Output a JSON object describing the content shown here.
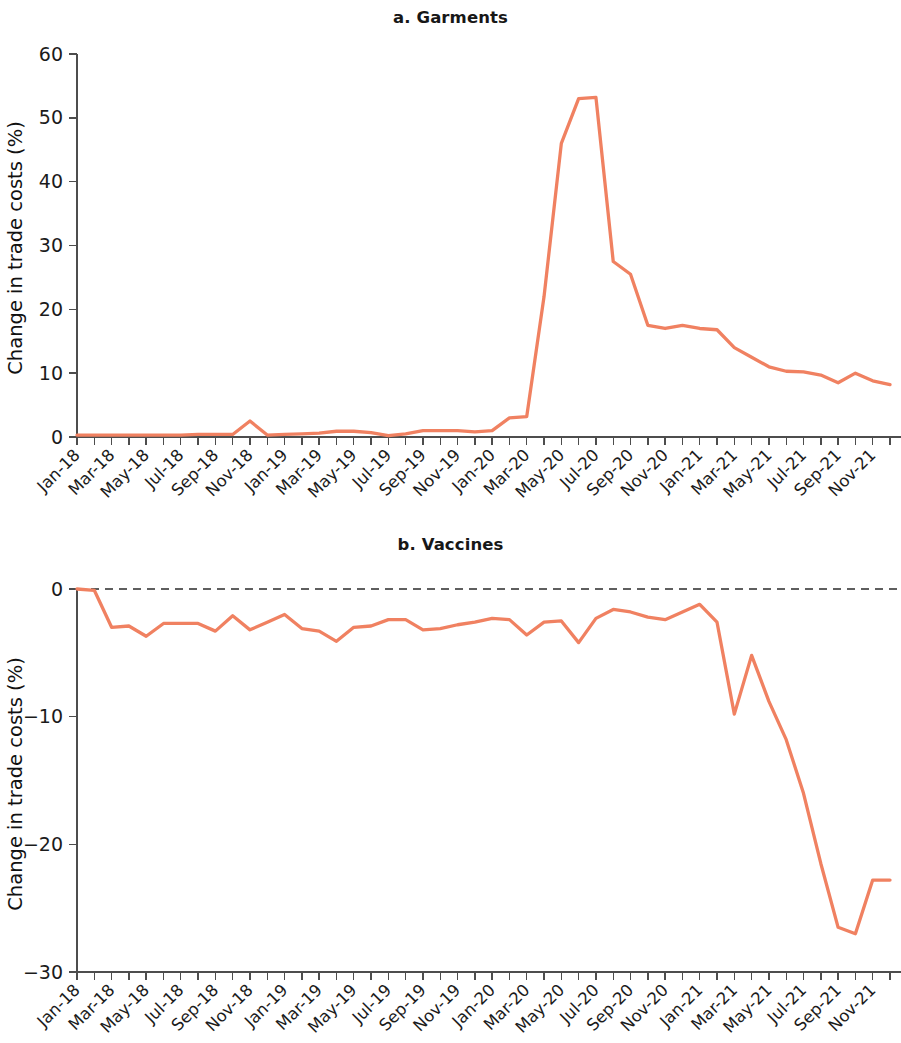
{
  "figure": {
    "line_color": "#F08161",
    "axis_color": "#4d4d4d",
    "zero_line_color": "#2a2a2a"
  },
  "panels": [
    {
      "id": "a",
      "title": "a. Garments"
    },
    {
      "id": "b",
      "title": "b. Vaccines"
    }
  ],
  "chart_data": [
    {
      "type": "line",
      "title": "a. Garments",
      "xlabel": "",
      "ylabel": "Change in trade costs (%)",
      "ylim": [
        0,
        60
      ],
      "yticks": [
        0,
        10,
        20,
        30,
        40,
        50,
        60
      ],
      "ytick_labels": [
        "0",
        "10",
        "20",
        "30",
        "40",
        "50",
        "60"
      ],
      "grid": false,
      "legend": "none",
      "zero_reference_line": false,
      "x": [
        "Jan-18",
        "Feb-18",
        "Mar-18",
        "Apr-18",
        "May-18",
        "Jun-18",
        "Jul-18",
        "Aug-18",
        "Sep-18",
        "Oct-18",
        "Nov-18",
        "Dec-18",
        "Jan-19",
        "Feb-19",
        "Mar-19",
        "Apr-19",
        "May-19",
        "Jun-19",
        "Jul-19",
        "Aug-19",
        "Sep-19",
        "Oct-19",
        "Nov-19",
        "Dec-19",
        "Jan-20",
        "Feb-20",
        "Mar-20",
        "Apr-20",
        "May-20",
        "Jun-20",
        "Jul-20",
        "Aug-20",
        "Sep-20",
        "Oct-20",
        "Nov-20",
        "Dec-20",
        "Jan-21",
        "Feb-21",
        "Mar-21",
        "Apr-21",
        "May-21",
        "Jun-21",
        "Jul-21",
        "Aug-21",
        "Sep-21",
        "Oct-21",
        "Nov-21",
        "Dec-21"
      ],
      "xtick_labels": [
        "Jan-18",
        "Mar-18",
        "May-18",
        "Jul-18",
        "Sep-18",
        "Nov-18",
        "Jan-19",
        "Mar-19",
        "May-19",
        "Jul-19",
        "Sep-19",
        "Nov-19",
        "Jan-20",
        "Mar-20",
        "May-20",
        "Jul-20",
        "Sep-20",
        "Nov-20",
        "Jan-21",
        "Mar-21",
        "May-21",
        "Jul-21",
        "Sep-21",
        "Nov-21"
      ],
      "values": [
        0.3,
        0.3,
        0.3,
        0.3,
        0.3,
        0.3,
        0.3,
        0.4,
        0.4,
        0.4,
        2.5,
        0.3,
        0.4,
        0.5,
        0.6,
        0.9,
        0.9,
        0.7,
        0.2,
        0.5,
        1.0,
        1.0,
        1.0,
        0.8,
        1.0,
        3.0,
        3.2,
        22.0,
        46.0,
        53.0,
        53.2,
        27.5,
        25.5,
        17.5,
        17.0,
        17.5,
        17.0,
        16.8,
        14.0,
        12.5,
        11.0,
        10.3,
        10.2,
        9.7,
        8.5,
        10.0,
        8.8,
        8.2
      ]
    },
    {
      "type": "line",
      "title": "b. Vaccines",
      "xlabel": "",
      "ylabel": "Change in trade costs (%)",
      "ylim": [
        -30,
        0
      ],
      "yticks": [
        0,
        -10,
        -20,
        -30
      ],
      "ytick_labels": [
        "0",
        "−10",
        "−20",
        "−30"
      ],
      "grid": false,
      "legend": "none",
      "zero_reference_line": true,
      "x": [
        "Jan-18",
        "Feb-18",
        "Mar-18",
        "Apr-18",
        "May-18",
        "Jun-18",
        "Jul-18",
        "Aug-18",
        "Sep-18",
        "Oct-18",
        "Nov-18",
        "Dec-18",
        "Jan-19",
        "Feb-19",
        "Mar-19",
        "Apr-19",
        "May-19",
        "Jun-19",
        "Jul-19",
        "Aug-19",
        "Sep-19",
        "Oct-19",
        "Nov-19",
        "Dec-19",
        "Jan-20",
        "Feb-20",
        "Mar-20",
        "Apr-20",
        "May-20",
        "Jun-20",
        "Jul-20",
        "Aug-20",
        "Sep-20",
        "Oct-20",
        "Nov-20",
        "Dec-20",
        "Jan-21",
        "Feb-21",
        "Mar-21",
        "Apr-21",
        "May-21",
        "Jun-21",
        "Jul-21",
        "Aug-21",
        "Sep-21",
        "Oct-21",
        "Nov-21",
        "Dec-21"
      ],
      "xtick_labels": [
        "Jan-18",
        "Mar-18",
        "May-18",
        "Jul-18",
        "Sep-18",
        "Nov-18",
        "Jan-19",
        "Mar-19",
        "May-19",
        "Jul-19",
        "Sep-19",
        "Nov-19",
        "Jan-20",
        "Mar-20",
        "May-20",
        "Jul-20",
        "Sep-20",
        "Nov-20",
        "Jan-21",
        "Mar-21",
        "May-21",
        "Jul-21",
        "Sep-21",
        "Nov-21"
      ],
      "values": [
        0.0,
        -0.1,
        -3.0,
        -2.9,
        -3.7,
        -2.7,
        -2.7,
        -2.7,
        -3.3,
        -2.1,
        -3.2,
        -2.6,
        -2.0,
        -3.1,
        -3.3,
        -4.1,
        -3.0,
        -2.9,
        -2.4,
        -2.4,
        -3.2,
        -3.1,
        -2.8,
        -2.6,
        -2.3,
        -2.4,
        -3.6,
        -2.6,
        -2.5,
        -4.2,
        -2.3,
        -1.6,
        -1.8,
        -2.2,
        -2.4,
        -1.8,
        -1.2,
        -2.6,
        -9.8,
        -5.2,
        -8.8,
        -11.8,
        -16.0,
        -21.5,
        -26.5,
        -27.0,
        -22.8,
        -22.8
      ]
    }
  ]
}
